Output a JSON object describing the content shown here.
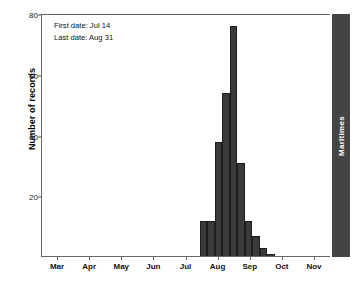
{
  "chart_data": {
    "type": "bar",
    "title": "",
    "subtitle": "",
    "xlabel": "",
    "ylabel": "Number of records",
    "ylim": [
      0,
      80
    ],
    "yticks": [
      20,
      40,
      60,
      80
    ],
    "grid": false,
    "legend_position": "none",
    "xtick_labels": [
      "Mar",
      "Apr",
      "May",
      "Jun",
      "Jul",
      "Aug",
      "Sep",
      "Oct",
      "Nov"
    ],
    "categories": [
      "Jul 14",
      "Jul 21",
      "Jul 28",
      "Aug 04",
      "Aug 11",
      "Aug 18",
      "Aug 25",
      "Sep 01",
      "Sep 08",
      "Sep 15"
    ],
    "values": [
      12,
      12,
      38,
      54,
      76,
      31,
      12,
      7,
      3,
      1
    ],
    "bar_color": "#3a3a3a",
    "annotations": [
      "First date: Jul 14",
      "Last date: Aug 31"
    ],
    "panel_label": "Maritimes"
  },
  "annotation": {
    "first_date": "First date: Jul 14",
    "last_date": "Last date: Aug 31"
  },
  "strip": {
    "label": "Maritimes"
  }
}
